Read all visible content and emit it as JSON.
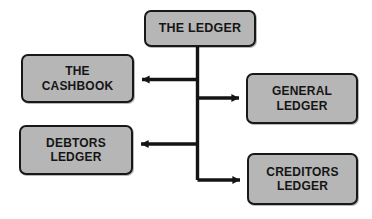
{
  "diagram": {
    "background_color": "#ffffff",
    "node_fill_color": "#b6b6b6",
    "node_border_color": "#181818",
    "connector_color": "#141414",
    "nodes": [
      {
        "id": "ledger",
        "label": "THE LEDGER"
      },
      {
        "id": "cashbook",
        "label": "THE\nCASHBOOK"
      },
      {
        "id": "general_ledger",
        "label": "GENERAL\nLEDGER"
      },
      {
        "id": "debtors_ledger",
        "label": "DEBTORS\nLEDGER"
      },
      {
        "id": "creditors_ledger",
        "label": "CREDITORS\nLEDGER"
      }
    ],
    "connectors": [
      {
        "id": "ledger-to-cashbook",
        "from": "ledger",
        "to": "cashbook",
        "direction": "left"
      },
      {
        "id": "ledger-to-general-ledger",
        "from": "ledger",
        "to": "general_ledger",
        "direction": "right"
      },
      {
        "id": "ledger-to-debtors-ledger",
        "from": "ledger",
        "to": "debtors_ledger",
        "direction": "left"
      },
      {
        "id": "ledger-to-creditors-ledger",
        "from": "ledger",
        "to": "creditors_ledger",
        "direction": "right"
      }
    ]
  }
}
